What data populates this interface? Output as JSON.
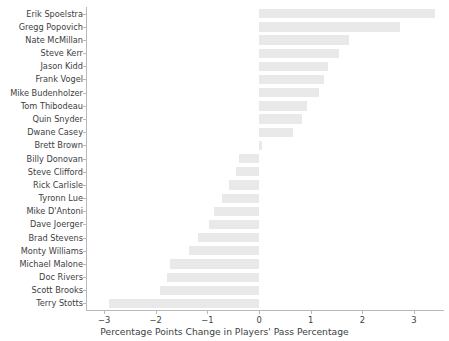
{
  "chart_data": {
    "type": "bar",
    "orientation": "horizontal",
    "title": "",
    "xlabel": "Percentage Points Change in Players' Pass Percentage",
    "ylabel": "",
    "xlim": [
      -3.35,
      3.58
    ],
    "ylim": [
      -0.6,
      22.6
    ],
    "xticks": [
      -3,
      -2,
      -1,
      0,
      1,
      2,
      3
    ],
    "xticklabels": [
      "−3",
      "−2",
      "−1",
      "0",
      "1",
      "2",
      "3"
    ],
    "grid": false,
    "legend": null,
    "bar_color": "#e9e9e9",
    "axis_color": "#b9b9b9",
    "text_color": "#3e3e3e",
    "categories": [
      "Erik Spoelstra",
      "Gregg Popovich",
      "Nate McMillan",
      "Steve Kerr",
      "Jason Kidd",
      "Frank Vogel",
      "Mike Budenholzer",
      "Tom Thibodeau",
      "Quin Snyder",
      "Dwane Casey",
      "Brett Brown",
      "Billy Donovan",
      "Steve Clifford",
      "Rick Carlisle",
      "Tyronn Lue",
      "Mike D'Antoni",
      "Dave Joerger",
      "Brad Stevens",
      "Monty Williams",
      "Michael Malone",
      "Doc Rivers",
      "Scott Brooks",
      "Terry Stotts"
    ],
    "values": [
      3.4,
      2.73,
      1.75,
      1.55,
      1.33,
      1.26,
      1.16,
      0.93,
      0.84,
      0.65,
      0.05,
      -0.39,
      -0.44,
      -0.58,
      -0.71,
      -0.87,
      -0.96,
      -1.18,
      -1.36,
      -1.72,
      -1.79,
      -1.92,
      -2.9
    ]
  }
}
